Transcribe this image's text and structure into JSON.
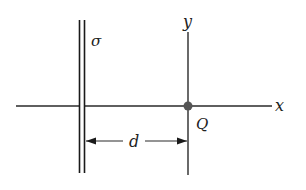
{
  "diagram": {
    "labels": {
      "sigma": "σ",
      "y_axis": "y",
      "x_axis": "x",
      "point": "Q",
      "distance": "d"
    },
    "colors": {
      "line": "#2a2a2a",
      "point": "#555555"
    }
  }
}
